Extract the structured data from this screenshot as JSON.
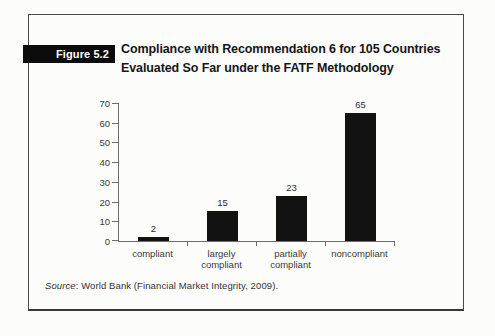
{
  "page": {
    "figure_label": "Figure 5.2",
    "title_line1": "Compliance with Recommendation 6 for 105 Countries",
    "title_line2": "Evaluated So Far under the FATF Methodology",
    "source_label": "Source",
    "source_text": ": World Bank (Financial Market Integrity, 2009)."
  },
  "colors": {
    "bar": "#121212",
    "axis": "#6d6d6d",
    "label_text": "#3a3a3a",
    "figure_box_bg": "#0c0c0c",
    "figure_box_text": "#ffffff",
    "frame_border": "#4a4a4a",
    "background": "#fcfcfb"
  },
  "chart_data": {
    "type": "bar",
    "categories": [
      "compliant",
      "largely compliant",
      "partially compliant",
      "noncompliant"
    ],
    "values": [
      2,
      15,
      23,
      65
    ],
    "title": "Compliance with Recommendation 6 for 105 Countries Evaluated So Far under the FATF Methodology",
    "xlabel": "",
    "ylabel": "",
    "ylim": [
      0,
      70
    ],
    "ytick_step": 10,
    "grid": false,
    "legend": false,
    "bar_value_labels_shown": true
  }
}
